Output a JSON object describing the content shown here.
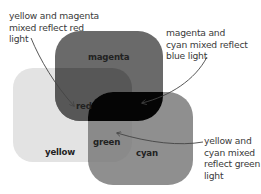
{
  "diagram": {
    "colors": {
      "background": "#ffffff",
      "yellow": "#e3e3e3",
      "magenta": "#6a6a6a",
      "cyan": "#8f8f8f",
      "red_overlap": "#575757",
      "blue_overlap": "#050505",
      "green_overlap": "#8a8a8a",
      "arrow": "#444444"
    },
    "regions": {
      "magenta": "magenta",
      "red": "red",
      "yellow": "yellow",
      "green": "green",
      "cyan": "cyan"
    },
    "captions": {
      "red": "yellow and magenta\nmixed reflect red\nlight",
      "blue": "magenta and\ncyan mixed reflect\nblue light",
      "green": "yellow and\ncyan mixed\nreflect green\nlight"
    }
  }
}
